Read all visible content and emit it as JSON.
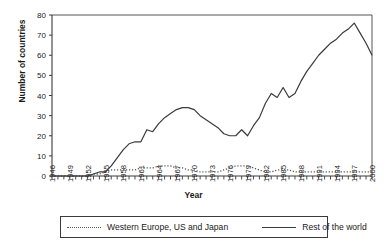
{
  "chart_data": {
    "type": "line",
    "title": "",
    "xlabel": "Year",
    "ylabel": "Number of countries",
    "xlim": [
      1946,
      2000
    ],
    "ylim": [
      0,
      80
    ],
    "yticks": [
      0,
      10,
      20,
      30,
      40,
      50,
      60,
      70,
      80
    ],
    "xticks": [
      1946,
      1949,
      1952,
      1955,
      1958,
      1961,
      1964,
      1967,
      1970,
      1973,
      1976,
      1979,
      1982,
      1985,
      1988,
      1991,
      1994,
      1997,
      2000
    ],
    "x_minor_tick_interval": 1,
    "grid": false,
    "legend_position": "bottom",
    "x": [
      1946,
      1947,
      1948,
      1949,
      1950,
      1951,
      1952,
      1953,
      1954,
      1955,
      1956,
      1957,
      1958,
      1959,
      1960,
      1961,
      1962,
      1963,
      1964,
      1965,
      1966,
      1967,
      1968,
      1969,
      1970,
      1971,
      1972,
      1973,
      1974,
      1975,
      1976,
      1977,
      1978,
      1979,
      1980,
      1981,
      1982,
      1983,
      1984,
      1985,
      1986,
      1987,
      1988,
      1989,
      1990,
      1991,
      1992,
      1993,
      1994,
      1995,
      1996,
      1997,
      1998,
      1999,
      2000
    ],
    "series": [
      {
        "name": "Western Europe, US and Japan",
        "style": "dotted",
        "color": "#555555",
        "values": [
          0,
          0,
          0,
          0,
          0,
          0,
          0,
          1,
          1,
          2,
          3,
          3,
          3,
          3,
          3,
          4,
          4,
          4,
          5,
          5,
          5,
          4,
          4,
          3,
          3,
          2,
          2,
          2,
          2,
          3,
          4,
          5,
          5,
          5,
          4,
          3,
          2,
          2,
          3,
          3,
          3,
          2,
          2,
          2,
          2,
          2,
          2,
          2,
          2,
          2,
          2,
          2,
          2,
          2,
          2
        ]
      },
      {
        "name": "Rest of the world",
        "style": "solid",
        "color": "#3a3a3a",
        "values": [
          0,
          0,
          0,
          0,
          0,
          0,
          0,
          1,
          2,
          2,
          5,
          9,
          13,
          16,
          17,
          17,
          23,
          22,
          26,
          29,
          31,
          33,
          34,
          34,
          33,
          30,
          28,
          26,
          24,
          21,
          20,
          20,
          23,
          20,
          25,
          29,
          36,
          41,
          39,
          44,
          39,
          41,
          47,
          52,
          56,
          60,
          63,
          66,
          68,
          71,
          73,
          76,
          71,
          66,
          60
        ]
      }
    ]
  },
  "legend": {
    "entries": [
      {
        "label": "Western Europe, US and Japan",
        "style": "dotted"
      },
      {
        "label": "Rest of the world",
        "style": "solid"
      }
    ]
  },
  "axis_titles": {
    "x": "Year",
    "y": "Number of countries"
  }
}
